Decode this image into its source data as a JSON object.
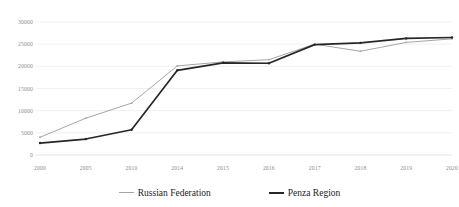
{
  "chart_data": {
    "type": "line",
    "title": "",
    "subtitle": "",
    "xlabel": "",
    "ylabel": "",
    "categories": [
      "2000",
      "2005",
      "2010",
      "2014",
      "2015",
      "2016",
      "2017",
      "2018",
      "2019",
      "2020"
    ],
    "x": [
      2000,
      2005,
      2010,
      2014,
      2015,
      2016,
      2017,
      2018,
      2019,
      2020
    ],
    "series": [
      {
        "name": "Russian Federation",
        "color": "#a6a6a6",
        "marker": "dot",
        "values": [
          4000,
          8300,
          11700,
          20100,
          21000,
          21500,
          25000,
          23400,
          25400,
          26200
        ]
      },
      {
        "name": "Penza Region",
        "color": "#262626",
        "marker": "dot",
        "values": [
          2700,
          3600,
          5700,
          19100,
          20800,
          20700,
          24900,
          25300,
          26300,
          26500
        ]
      }
    ],
    "ylim": [
      0,
      30000
    ],
    "yticks": [
      0,
      5000,
      10000,
      15000,
      20000,
      25000,
      30000
    ],
    "ytick_labels": [
      "0",
      "5000",
      "10000",
      "15000",
      "20000",
      "25000",
      "30000"
    ],
    "grid": true,
    "grid_axis": "y",
    "legend_position": "bottom",
    "legend": [
      "Russian Federation",
      "Penza Region"
    ],
    "annotations": []
  },
  "legend": {
    "items": [
      {
        "label": "Russian Federation",
        "color": "#a6a6a6"
      },
      {
        "label": "Penza Region",
        "color": "#262626"
      }
    ]
  },
  "colors": {
    "russian_federation": "#a6a6a6",
    "penza_region": "#262626",
    "gridline": "#e9e9e9",
    "tick_text": "#8a8a8a",
    "legend_text": "#1c1c1c",
    "background": "#ffffff"
  }
}
